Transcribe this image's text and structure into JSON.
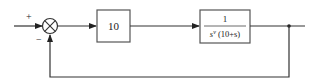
{
  "diagram": {
    "type": "feedback-control-block-diagram",
    "summing_junction": {
      "plus_sign": "+",
      "minus_sign": "−"
    },
    "forward_blocks": [
      {
        "label": "10"
      },
      {
        "numerator": "1",
        "denominator_base": "s",
        "denominator_exponent": "ν",
        "denominator_tail": " (10+s)"
      }
    ],
    "feedback": "unity negative feedback",
    "colors": {
      "line": "#333333",
      "block_border": "#555555",
      "background": "#ffffff"
    }
  }
}
